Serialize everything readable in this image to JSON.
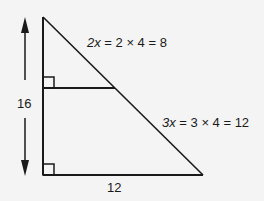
{
  "diagram": {
    "type": "similar right triangles",
    "labels": {
      "height": "16",
      "base": "12",
      "upper_segment_var": "2x",
      "upper_segment_expr": " = 2 × 4 = 8",
      "lower_segment_var": "3x",
      "lower_segment_expr": " = 3 × 4 = 12"
    },
    "colors": {
      "line": "#1a1a1a",
      "background": "#f4f4f4"
    }
  }
}
